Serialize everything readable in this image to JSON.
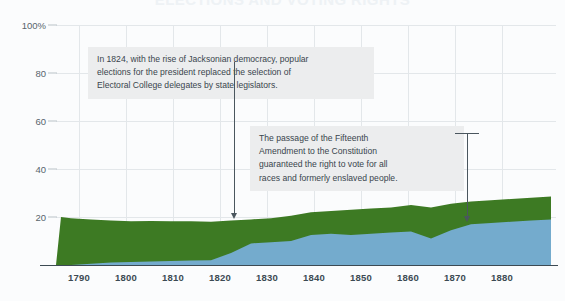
{
  "cut_title": "ELECTIONS AND VOTING RIGHTS",
  "chart_data": {
    "type": "area",
    "stacked": true,
    "title": "",
    "subtitle": "",
    "xlabel": "",
    "ylabel": "",
    "xlim": [
      1789,
      1889
    ],
    "ylim": [
      0,
      100
    ],
    "grid": true,
    "legend_position": "none",
    "y_ticks": [
      "100%",
      "80",
      "60",
      "40",
      "20"
    ],
    "y_tick_values": [
      100,
      80,
      60,
      40,
      20
    ],
    "x_ticks": [
      "1790",
      "1800",
      "1810",
      "1820",
      "1830",
      "1840",
      "1850",
      "1860",
      "1870",
      "1880"
    ],
    "x_tick_values": [
      1790,
      1800,
      1810,
      1820,
      1830,
      1840,
      1850,
      1860,
      1870,
      1880
    ],
    "colors": {
      "series_bottom": "#74abcd",
      "series_top": "#3d7a23",
      "gridline": "#e3e7ea",
      "axis": "#3c4a53",
      "background": "#fbfcfd",
      "annotation_background": "#ecedee",
      "annotation_text": "#39454d",
      "annotation_rule": "#4a565e"
    },
    "x": [
      1789,
      1790,
      1792,
      1796,
      1800,
      1804,
      1808,
      1812,
      1816,
      1820,
      1824,
      1828,
      1832,
      1836,
      1840,
      1844,
      1848,
      1852,
      1856,
      1860,
      1864,
      1868,
      1872,
      1876,
      1880,
      1884,
      1888
    ],
    "series": [
      {
        "name": "Votes cast for president",
        "color": "#74abcd",
        "values": [
          0,
          0,
          0,
          0.5,
          1,
          1.2,
          1.5,
          1.7,
          1.9,
          2,
          5,
          9,
          9.5,
          10,
          12.5,
          13,
          12.5,
          13,
          13.5,
          14,
          11,
          14.5,
          17,
          17.5,
          18,
          18.5,
          19
        ]
      },
      {
        "name": "Eligible voters not voting",
        "color": "#3d7a23",
        "values": [
          0,
          20,
          19.5,
          18.5,
          17.5,
          17,
          16.8,
          16.5,
          16.3,
          16,
          13.5,
          10,
          10,
          10.5,
          9.5,
          9.5,
          10.5,
          10.5,
          10.5,
          11,
          13,
          11,
          9.5,
          9.5,
          9.5,
          9.5,
          9.5
        ]
      }
    ],
    "total_top": [
      0,
      20,
      19.5,
      19,
      18.5,
      18.2,
      18.3,
      18.2,
      18.2,
      18,
      18.5,
      19,
      19.5,
      20.5,
      22,
      22.5,
      23,
      23.5,
      24,
      25,
      24,
      25.5,
      26.5,
      27,
      27.5,
      28,
      28.5
    ]
  },
  "annotations": [
    {
      "id": "annot-1",
      "text": "In 1824, with the rise of Jacksonian democracy, popular\nelections for the president replaced the selection of\nElectoral College delegates by state legislators.",
      "points_to_year": 1824,
      "marker": "arrow-down"
    },
    {
      "id": "annot-2",
      "text": "The passage of the Fifteenth\nAmendment to the Constitution\nguaranteed the right to vote for all\nraces and formerly enslaved people.",
      "points_to_year": 1870,
      "marker": "arrow-down-bracket"
    }
  ]
}
